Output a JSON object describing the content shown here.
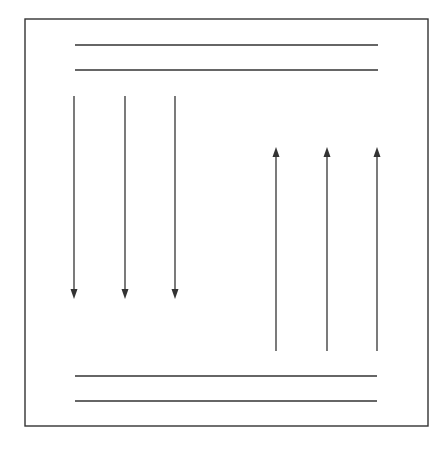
{
  "diagram": {
    "width": 446,
    "height": 450,
    "stroke_color": "#333333",
    "background": "#ffffff",
    "frame": {
      "x": 25,
      "y": 19,
      "width": 403,
      "height": 407
    },
    "horizontal_lines": [
      {
        "name": "top-line-1",
        "x1": 75,
        "x2": 378,
        "y": 45
      },
      {
        "name": "top-line-2",
        "x1": 75,
        "x2": 378,
        "y": 70
      },
      {
        "name": "bottom-line-1",
        "x1": 75,
        "x2": 377,
        "y": 376
      },
      {
        "name": "bottom-line-2",
        "x1": 75,
        "x2": 377,
        "y": 401
      }
    ],
    "down_arrows": [
      {
        "x": 74,
        "y_start": 96,
        "y_tip": 299
      },
      {
        "x": 125,
        "y_start": 96,
        "y_tip": 299
      },
      {
        "x": 175,
        "y_start": 96,
        "y_tip": 299
      }
    ],
    "up_arrows": [
      {
        "x": 276,
        "y_start": 351,
        "y_tip": 147
      },
      {
        "x": 327,
        "y_start": 351,
        "y_tip": 147
      },
      {
        "x": 377,
        "y_start": 351,
        "y_tip": 147
      }
    ]
  }
}
